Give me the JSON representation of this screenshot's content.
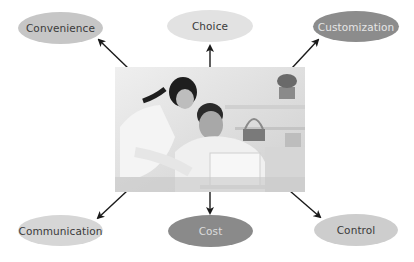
{
  "diagram": {
    "center": {
      "label": "photo-couple-at-laptop",
      "description": "Grayscale photo of a woman and man looking at a laptop"
    },
    "nodes": [
      {
        "id": "convenience",
        "label": "Convenience",
        "fill": "#c6c6c6",
        "text_color": "#3a3a3a"
      },
      {
        "id": "choice",
        "label": "Choice",
        "fill": "#e2e2e2",
        "text_color": "#3a3a3a"
      },
      {
        "id": "customization",
        "label": "Customization",
        "fill": "#8c8c8c",
        "text_color": "#e6e6e6"
      },
      {
        "id": "communication",
        "label": "Communication",
        "fill": "#d6d6d6",
        "text_color": "#3a3a3a"
      },
      {
        "id": "cost",
        "label": "Cost",
        "fill": "#8a8a8a",
        "text_color": "#dcdcdc"
      },
      {
        "id": "control",
        "label": "Control",
        "fill": "#cdcdcd",
        "text_color": "#3a3a3a"
      }
    ],
    "arrow_color": "#1a1a1a"
  }
}
